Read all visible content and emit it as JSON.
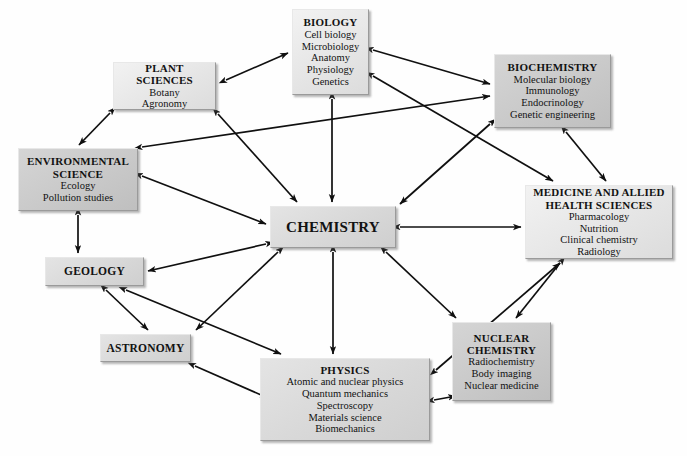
{
  "diagram": {
    "background": "#ffffff",
    "line_color": "#101010",
    "nodes": [
      {
        "id": "biology",
        "title": "BIOLOGY",
        "items": [
          "Cell biology",
          "Microbiology",
          "Anatomy",
          "Physiology",
          "Genetics"
        ],
        "x": 292,
        "y": 9,
        "w": 77,
        "h": 86,
        "shade": "sh-light",
        "title_size": 11,
        "item_size": 10.5
      },
      {
        "id": "plant-sciences",
        "title": "PLANT SCIENCES",
        "items": [
          "Botany",
          "Agronomy"
        ],
        "x": 113,
        "y": 62,
        "w": 103,
        "h": 48,
        "shade": "sh-light",
        "title_size": 11,
        "item_size": 10.5
      },
      {
        "id": "biochemistry",
        "title": "BIOCHEMISTRY",
        "items": [
          "Molecular biology",
          "Immunology",
          "Endocrinology",
          "Genetic engineering"
        ],
        "x": 494,
        "y": 54,
        "w": 117,
        "h": 74,
        "shade": "sh-dark",
        "title_size": 11,
        "item_size": 10.5
      },
      {
        "id": "environmental-science",
        "title": "ENVIRONMENTAL SCIENCE",
        "items": [
          "Ecology",
          "Pollution studies"
        ],
        "x": 18,
        "y": 148,
        "w": 120,
        "h": 63,
        "shade": "sh-dark",
        "title_size": 11,
        "item_size": 10.5
      },
      {
        "id": "medicine",
        "title": "MEDICINE AND ALLIED HEALTH SCIENCES",
        "items": [
          "Pharmacology",
          "Nutrition",
          "Clinical chemistry",
          "Radiology"
        ],
        "x": 525,
        "y": 185,
        "w": 148,
        "h": 74,
        "shade": "sh-light",
        "title_size": 11,
        "item_size": 10.5
      },
      {
        "id": "chemistry",
        "title": "CHEMISTRY",
        "items": [],
        "x": 270,
        "y": 206,
        "w": 126,
        "h": 42,
        "shade": "sh-mid",
        "title_size": 15,
        "item_size": 10.5
      },
      {
        "id": "geology",
        "title": "GEOLOGY",
        "items": [],
        "x": 45,
        "y": 257,
        "w": 99,
        "h": 29,
        "shade": "sh-mid",
        "title_size": 11.5,
        "item_size": 10.5
      },
      {
        "id": "astronomy",
        "title": "ASTRONOMY",
        "items": [],
        "x": 100,
        "y": 334,
        "w": 91,
        "h": 28,
        "shade": "sh-mid",
        "title_size": 11.5,
        "item_size": 10.5
      },
      {
        "id": "nuclear-chemistry",
        "title": "NUCLEAR CHEMISTRY",
        "items": [
          "Radiochemistry",
          "Body imaging",
          "Nuclear medicine"
        ],
        "x": 452,
        "y": 322,
        "w": 99,
        "h": 79,
        "shade": "sh-dark",
        "title_size": 11,
        "item_size": 10.5
      },
      {
        "id": "physics",
        "title": "PHYSICS",
        "items": [
          "Atomic and nuclear physics",
          "Quantum mechanics",
          "Spectroscopy",
          "Materials science",
          "Biomechanics"
        ],
        "x": 260,
        "y": 358,
        "w": 170,
        "h": 83,
        "shade": "sh-mid",
        "title_size": 11,
        "item_size": 10.5
      }
    ],
    "edges": [
      {
        "from": "plant-sciences",
        "to": "biology",
        "x1": 226,
        "y1": 80,
        "x2": 288,
        "y2": 53,
        "heads": "both"
      },
      {
        "from": "plant-sciences",
        "to": "environmental-science",
        "x1": 110,
        "y1": 113,
        "x2": 79,
        "y2": 145,
        "heads": "both"
      },
      {
        "from": "plant-sciences",
        "to": "chemistry",
        "x1": 218,
        "y1": 114,
        "x2": 297,
        "y2": 202,
        "heads": "both"
      },
      {
        "from": "environmental-science",
        "to": "biochemistry",
        "x1": 142,
        "y1": 147,
        "x2": 490,
        "y2": 96,
        "heads": "both"
      },
      {
        "from": "environmental-science",
        "to": "chemistry",
        "x1": 142,
        "y1": 176,
        "x2": 266,
        "y2": 224,
        "heads": "both"
      },
      {
        "from": "environmental-science",
        "to": "geology",
        "x1": 78,
        "y1": 215,
        "x2": 78,
        "y2": 253,
        "heads": "both"
      },
      {
        "from": "biology",
        "to": "chemistry",
        "x1": 332,
        "y1": 99,
        "x2": 332,
        "y2": 202,
        "heads": "both"
      },
      {
        "from": "biology",
        "to": "biochemistry",
        "x1": 373,
        "y1": 50,
        "x2": 490,
        "y2": 84,
        "heads": "both"
      },
      {
        "from": "biology",
        "to": "medicine",
        "x1": 373,
        "y1": 76,
        "x2": 553,
        "y2": 181,
        "heads": "both"
      },
      {
        "from": "biochemistry",
        "to": "chemistry",
        "x1": 490,
        "y1": 124,
        "x2": 400,
        "y2": 204,
        "heads": "both"
      },
      {
        "from": "biochemistry",
        "to": "medicine",
        "x1": 566,
        "y1": 132,
        "x2": 606,
        "y2": 181,
        "heads": "both"
      },
      {
        "from": "chemistry",
        "to": "medicine",
        "x1": 400,
        "y1": 227,
        "x2": 521,
        "y2": 227,
        "heads": "both"
      },
      {
        "from": "chemistry",
        "to": "geology",
        "x1": 266,
        "y1": 244,
        "x2": 148,
        "y2": 271,
        "heads": "both"
      },
      {
        "from": "chemistry",
        "to": "physics",
        "x1": 333,
        "y1": 252,
        "x2": 333,
        "y2": 354,
        "heads": "both"
      },
      {
        "from": "chemistry",
        "to": "astronomy",
        "x1": 278,
        "y1": 252,
        "x2": 196,
        "y2": 330,
        "heads": "both"
      },
      {
        "from": "chemistry",
        "to": "nuclear-chemistry",
        "x1": 386,
        "y1": 252,
        "x2": 456,
        "y2": 318,
        "heads": "both"
      },
      {
        "from": "geology",
        "to": "astronomy",
        "x1": 106,
        "y1": 290,
        "x2": 148,
        "y2": 330,
        "heads": "both"
      },
      {
        "from": "geology",
        "to": "physics",
        "x1": 126,
        "y1": 290,
        "x2": 281,
        "y2": 354,
        "heads": "both"
      },
      {
        "from": "astronomy",
        "to": "physics",
        "x1": 195,
        "y1": 366,
        "x2": 268,
        "y2": 398,
        "heads": "both"
      },
      {
        "from": "physics",
        "to": "nuclear-chemistry",
        "x1": 434,
        "y1": 400,
        "x2": 456,
        "y2": 396,
        "heads": "both"
      },
      {
        "from": "physics",
        "to": "medicine",
        "x1": 436,
        "y1": 370,
        "x2": 560,
        "y2": 263,
        "heads": "both"
      },
      {
        "from": "medicine",
        "to": "nuclear-chemistry",
        "x1": 560,
        "y1": 263,
        "x2": 516,
        "y2": 318,
        "heads": "both"
      }
    ]
  }
}
